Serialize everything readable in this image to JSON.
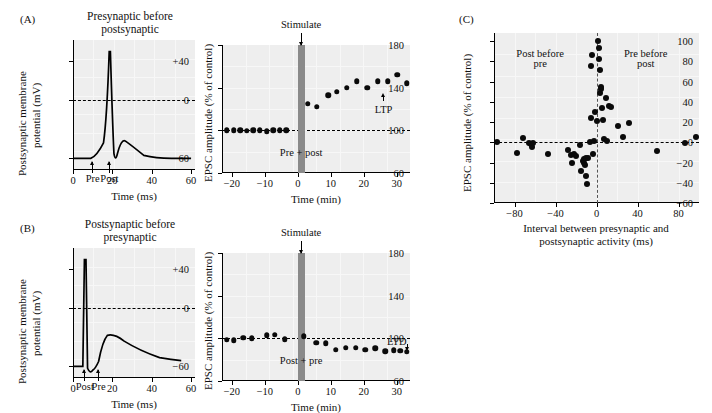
{
  "figure": {
    "panels": [
      {
        "id": "A",
        "label": "(A)",
        "title_line1": "Presynaptic before",
        "title_line2": "postsynaptic"
      },
      {
        "id": "B",
        "label": "(B)",
        "title_line1": "Postsynaptic before",
        "title_line2": "presynaptic"
      },
      {
        "id": "C",
        "label": "(C)"
      }
    ]
  },
  "panelA_trace": {
    "ylabel_line1": "Postsynaptic membrane",
    "ylabel_line2": "potential (mV)",
    "xlabel": "Time (ms)",
    "yticks": [
      "+40",
      "0",
      "−60"
    ],
    "ytick_values": [
      40,
      0,
      -60
    ],
    "xticks": [
      "0",
      "20",
      "40",
      "60"
    ],
    "xtick_values": [
      0,
      20,
      40,
      60
    ],
    "xlim": [
      0,
      62
    ],
    "ylim": [
      -72,
      62
    ],
    "zero_line": 0,
    "marker_labels": [
      "Pre",
      "Post"
    ],
    "marker_x": [
      10,
      18.5
    ]
  },
  "panelB_trace": {
    "ylabel_line1": "Postsynaptic membrane",
    "ylabel_line2": "potential (mV)",
    "xlabel": "Time (ms)",
    "yticks": [
      "+40",
      "0",
      "−60"
    ],
    "ytick_values": [
      40,
      0,
      -60
    ],
    "xticks": [
      "0",
      "20",
      "40",
      "60"
    ],
    "xtick_values": [
      0,
      20,
      40,
      60
    ],
    "xlim": [
      0,
      62
    ],
    "ylim": [
      -72,
      62
    ],
    "zero_line": 0,
    "marker_labels": [
      "Post",
      "Pre"
    ],
    "marker_x": [
      6,
      13
    ]
  },
  "chart_data": [
    {
      "id": "panelA_ltp",
      "type": "scatter",
      "title": "",
      "xlabel": "Time (min)",
      "ylabel": "EPSC amplitude (% of control)",
      "xticks": [
        -20,
        -10,
        0,
        10,
        20,
        30
      ],
      "yticks": [
        60,
        100,
        140,
        180
      ],
      "xlim": [
        -23,
        34
      ],
      "ylim": [
        60,
        180
      ],
      "baseline": 100,
      "annotations": [
        {
          "text": "Stimulate",
          "x": 1,
          "y": 185
        },
        {
          "text": "Pre + post",
          "x": 1,
          "y": 78
        },
        {
          "text": "LTP",
          "x": 26,
          "y": 118
        }
      ],
      "stim_bar": {
        "x_start": 0,
        "x_end": 2.2,
        "color": "#8a8a8a"
      },
      "x": [
        -21.5,
        -19.5,
        -17.5,
        -15.5,
        -13.5,
        -11.5,
        -9.5,
        -7.5,
        -5.5,
        -3.5,
        3.0,
        5.8,
        9.2,
        11.8,
        14.8,
        17.8,
        21.0,
        24.2,
        27.2,
        30.2,
        33.0
      ],
      "values": [
        100,
        100,
        100,
        99.5,
        100,
        100,
        99,
        100,
        100,
        100,
        125,
        122,
        133,
        136,
        140,
        146,
        140,
        146,
        146,
        152,
        144
      ]
    },
    {
      "id": "panelB_ltd",
      "type": "scatter",
      "title": "",
      "xlabel": "Time (min)",
      "ylabel": "EPSC amplitude (% of control)",
      "xticks": [
        -20,
        -10,
        0,
        10,
        20,
        30
      ],
      "yticks": [
        60,
        100,
        140,
        180
      ],
      "xlim": [
        -23,
        34
      ],
      "ylim": [
        60,
        180
      ],
      "baseline": 100,
      "annotations": [
        {
          "text": "Stimulate",
          "x": 1,
          "y": 185
        },
        {
          "text": "Post + pre",
          "x": 1,
          "y": 78
        },
        {
          "text": "LTD",
          "x": 30,
          "y": 96
        }
      ],
      "stim_bar": {
        "x_start": 0,
        "x_end": 2.2,
        "color": "#8a8a8a"
      },
      "x": [
        -21.5,
        -19.5,
        -16.5,
        -14.0,
        -9.5,
        -7.0,
        -4.0,
        1.8,
        5.5,
        8.5,
        11.5,
        14.5,
        17.5,
        20.5,
        23.5,
        26.5,
        29.0,
        31.0,
        33.0
      ],
      "values": [
        98.5,
        98,
        100.5,
        100,
        103,
        103.5,
        99,
        102,
        96,
        95.5,
        89.5,
        91,
        91,
        89.5,
        90.5,
        88,
        89,
        88.5,
        87.5
      ]
    },
    {
      "id": "panelC_stdp",
      "type": "scatter",
      "title": "",
      "xlabel_line1": "Interval between presynaptic and",
      "xlabel_line2": "postsynaptic activity (ms)",
      "ylabel": "EPSC amplitude (% of control)",
      "xticks": [
        -80,
        -40,
        0,
        40,
        80
      ],
      "yticks": [
        -60,
        -40,
        -20,
        0,
        20,
        40,
        60,
        80,
        100
      ],
      "xlim": [
        -100,
        100
      ],
      "ylim": [
        -60,
        108
      ],
      "hline": 0,
      "vline": 0,
      "annotations": [
        {
          "text": "Post before",
          "x": -55,
          "y": 86
        },
        {
          "text": "pre",
          "x": -55,
          "y": 76
        },
        {
          "text": "Pre before",
          "x": 48,
          "y": 86
        },
        {
          "text": "post",
          "x": 48,
          "y": 76
        }
      ],
      "points": [
        [
          -97,
          0
        ],
        [
          -78,
          -11
        ],
        [
          -72,
          4
        ],
        [
          -66,
          -1
        ],
        [
          -64,
          -2
        ],
        [
          -63,
          -5
        ],
        [
          -62,
          -1
        ],
        [
          -47,
          -12
        ],
        [
          -28,
          -8
        ],
        [
          -25,
          -13
        ],
        [
          -24,
          -20
        ],
        [
          -22,
          -12
        ],
        [
          -20,
          -14
        ],
        [
          -16,
          -3
        ],
        [
          -15,
          -28
        ],
        [
          -13,
          -18
        ],
        [
          -12,
          -17
        ],
        [
          -12,
          -20
        ],
        [
          -11,
          -22
        ],
        [
          -10,
          -16
        ],
        [
          -10,
          -33
        ],
        [
          -9,
          -41
        ],
        [
          -8,
          -16
        ],
        [
          -6,
          0
        ],
        [
          -5,
          24
        ],
        [
          -5,
          75
        ],
        [
          -4,
          86
        ],
        [
          -3,
          -12
        ],
        [
          -2,
          1
        ],
        [
          -1,
          30
        ],
        [
          0,
          21
        ],
        [
          1,
          100
        ],
        [
          2,
          93
        ],
        [
          2,
          82
        ],
        [
          3,
          71
        ],
        [
          3,
          49
        ],
        [
          4,
          55
        ],
        [
          4,
          53
        ],
        [
          5,
          34
        ],
        [
          6,
          22
        ],
        [
          7,
          3
        ],
        [
          9,
          44
        ],
        [
          10,
          1
        ],
        [
          12,
          36
        ],
        [
          14,
          35
        ],
        [
          21,
          16
        ],
        [
          26,
          5
        ],
        [
          32,
          19
        ],
        [
          59,
          -9
        ],
        [
          86,
          -1
        ],
        [
          97,
          5
        ]
      ]
    }
  ]
}
